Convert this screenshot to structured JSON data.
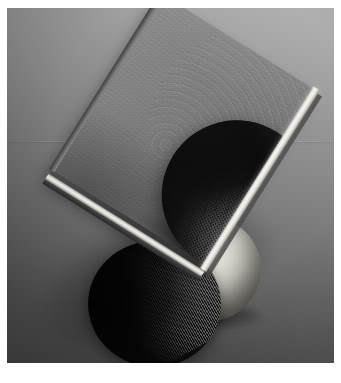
{
  "image": {
    "kind": "3d-rendered-still-life",
    "title": "Tilted plate with dark dimpled sphere",
    "width_px": 341,
    "height_px": 383,
    "matte_color": "#ffffff",
    "matte_inset_px": 7
  },
  "background": {
    "name": "studio-backdrop",
    "type": "linear-gradient",
    "direction_deg": 200,
    "light_corner": "upper-right",
    "dark_corner": "lower-left",
    "light_color": "#b4b4b4",
    "mid_color": "#747474",
    "dark_color": "#424242",
    "horizon_line_y_px": 133,
    "has_film_grain": true
  },
  "objects": {
    "board": {
      "name": "tilted-plate",
      "shape": "rectangular-slab",
      "rotation_deg": 32,
      "face_color": "#7a7a7a",
      "side_color": "#414141",
      "bevel_highlight_color": "#f6f5f1",
      "surface": "brushed-fibrous",
      "width_px": 175,
      "height_px": 207
    },
    "sphere_main": {
      "name": "dark-dimpled-sphere",
      "position": "resting-on-plate",
      "diameter_px": 150,
      "base_color": "#0b0b0b",
      "highlight_color": "#4a4a4a",
      "texture": "cross-hatched-dimple-mesh",
      "lit_from": "lower-right"
    },
    "sphere_light": {
      "name": "glossy-white-sphere",
      "position": "behind-plate",
      "diameter_px": 104,
      "base_color": "#f2f0ec",
      "shade_color": "#65625d",
      "texture": "smooth-glossy"
    },
    "sphere_lower": {
      "name": "dark-ribbed-sphere",
      "position": "below-left-of-plate",
      "diameter_px": 133,
      "base_color": "#090909",
      "highlight_color": "#d2d2d2",
      "texture": "fine-parallel-ribs",
      "rib_angle_deg": -28
    }
  },
  "lighting": {
    "key_light": "upper-right",
    "cast_shadow_color": "rgba(0,0,0,0.40)",
    "contact_shadows": true
  }
}
